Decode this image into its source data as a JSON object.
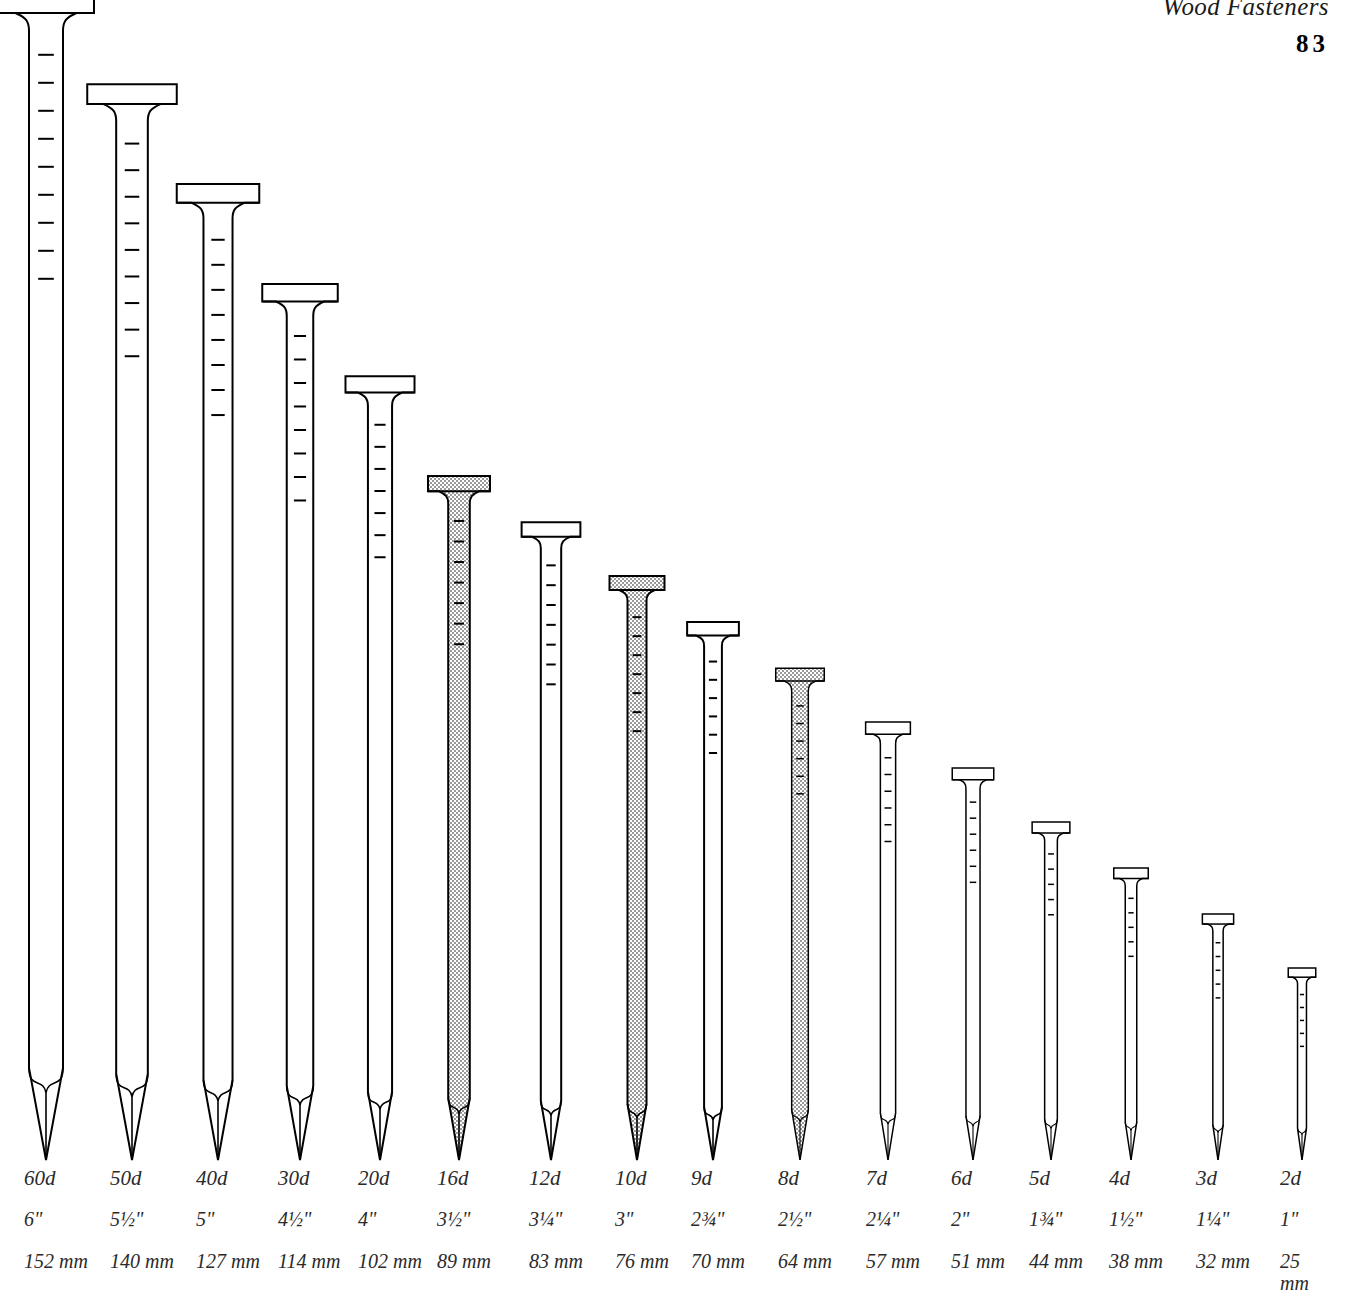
{
  "header": {
    "book_title": "Wood Fasteners",
    "page_number": "83"
  },
  "colors": {
    "outline": "#000000",
    "shade_fill": "#c9c9c9",
    "background": "#ffffff",
    "text": "#2a2a2a"
  },
  "chart_data": {
    "type": "bar",
    "title": "Wood Fasteners",
    "subtitle": "Common nail sizes",
    "xlabel": "",
    "ylabel": "Length",
    "categories": [
      "60d",
      "50d",
      "40d",
      "30d",
      "20d",
      "16d",
      "12d",
      "10d",
      "9d",
      "8d",
      "7d",
      "6d",
      "5d",
      "4d",
      "3d",
      "2d"
    ],
    "values": [
      152,
      140,
      127,
      114,
      102,
      89,
      83,
      76,
      70,
      64,
      57,
      51,
      44,
      38,
      32,
      25
    ],
    "unit": "mm",
    "ylim": [
      0,
      152
    ],
    "grid": false,
    "legend": null,
    "series": [
      {
        "name": "Length (inches)",
        "values": [
          "6\"",
          "5½\"",
          "5\"",
          "4½\"",
          "4\"",
          "3½\"",
          "3¼\"",
          "3\"",
          "2¾\"",
          "2½\"",
          "2¼\"",
          "2\"",
          "1¾\"",
          "1½\"",
          "1¼\"",
          "1\""
        ]
      },
      {
        "name": "Length (millimeters)",
        "values": [
          "152 mm",
          "140 mm",
          "127 mm",
          "114 mm",
          "102 mm",
          "89 mm",
          "83 mm",
          "76 mm",
          "70 mm",
          "64 mm",
          "57 mm",
          "51 mm",
          "44 mm",
          "38 mm",
          "32 mm",
          "25 mm"
        ]
      }
    ]
  },
  "nails": [
    {
      "penny": "60d",
      "inches": "6\"",
      "mm": "152 mm",
      "shaded": false
    },
    {
      "penny": "50d",
      "inches": "5½\"",
      "mm": "140 mm",
      "shaded": false
    },
    {
      "penny": "40d",
      "inches": "5\"",
      "mm": "127 mm",
      "shaded": false
    },
    {
      "penny": "30d",
      "inches": "4½\"",
      "mm": "114 mm",
      "shaded": false
    },
    {
      "penny": "20d",
      "inches": "4\"",
      "mm": "102 mm",
      "shaded": false
    },
    {
      "penny": "16d",
      "inches": "3½\"",
      "mm": "89 mm",
      "shaded": true
    },
    {
      "penny": "12d",
      "inches": "3¼\"",
      "mm": "83 mm",
      "shaded": false
    },
    {
      "penny": "10d",
      "inches": "3\"",
      "mm": "76 mm",
      "shaded": true
    },
    {
      "penny": "9d",
      "inches": "2¾\"",
      "mm": "70 mm",
      "shaded": false
    },
    {
      "penny": "8d",
      "inches": "2½\"",
      "mm": "64 mm",
      "shaded": true
    },
    {
      "penny": "7d",
      "inches": "2¼\"",
      "mm": "57 mm",
      "shaded": false
    },
    {
      "penny": "6d",
      "inches": "2\"",
      "mm": "51 mm",
      "shaded": false
    },
    {
      "penny": "5d",
      "inches": "1¾\"",
      "mm": "44 mm",
      "shaded": false
    },
    {
      "penny": "4d",
      "inches": "1½\"",
      "mm": "38 mm",
      "shaded": false
    },
    {
      "penny": "3d",
      "inches": "1¼\"",
      "mm": "32 mm",
      "shaded": false
    },
    {
      "penny": "2d",
      "inches": "1\"",
      "mm": "25 mm",
      "shaded": false
    }
  ]
}
